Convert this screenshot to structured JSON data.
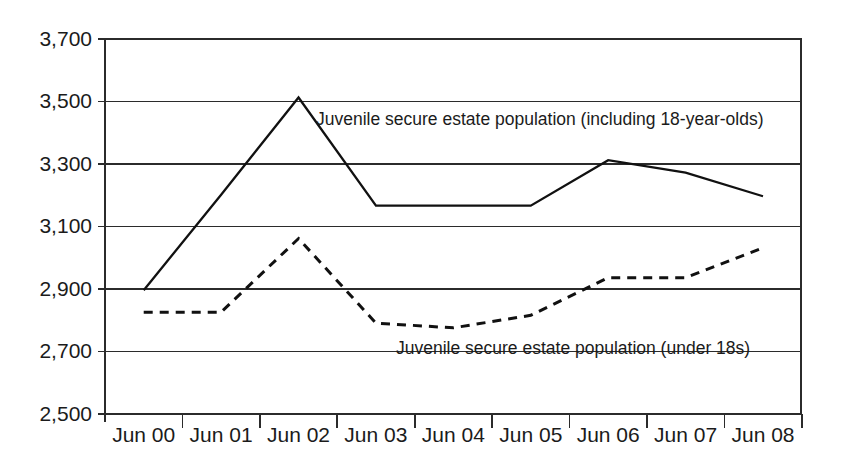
{
  "chart_data": {
    "type": "line",
    "title": "",
    "subtitle": "",
    "xlabel": "",
    "ylabel": "",
    "grid": true,
    "legend_position": "inline-annotation",
    "categories": [
      "Jun 00",
      "Jun 01",
      "Jun 02",
      "Jun 03",
      "Jun 04",
      "Jun 05",
      "Jun 06",
      "Jun 07",
      "Jun 08"
    ],
    "ylim": [
      2500,
      3700
    ],
    "ytick_values": [
      3700,
      3500,
      3300,
      3100,
      2900,
      2700,
      2500
    ],
    "ytick_labels": [
      "3,700",
      "3,500",
      "3,300",
      "3,100",
      "2,900",
      "2,700",
      "2,500"
    ],
    "series": [
      {
        "name": "Juvenile secure estate population (including 18-year-olds)",
        "style": "solid",
        "values": [
          2895,
          3200,
          3510,
          3165,
          3165,
          3165,
          3310,
          3270,
          3195
        ]
      },
      {
        "name": "Juvenile secure estate population (under 18s)",
        "style": "dashed",
        "values": [
          2825,
          2825,
          3060,
          2790,
          2775,
          2815,
          2935,
          2935,
          3030
        ]
      }
    ],
    "annotations": [
      {
        "text": "Juvenile secure estate population (including 18-year-olds)",
        "series": "solid",
        "x": 316,
        "y": 120
      },
      {
        "text": "Juvenile secure estate population (under 18s)",
        "series": "dashed",
        "x": 396,
        "y": 349
      }
    ]
  },
  "axes": {
    "y_labels": [
      "3,700",
      "3,500",
      "3,300",
      "3,100",
      "2,900",
      "2,700",
      "2,500"
    ],
    "x_labels": [
      "Jun 00",
      "Jun 01",
      "Jun 02",
      "Jun 03",
      "Jun 04",
      "Jun 05",
      "Jun 06",
      "Jun 07",
      "Jun 08"
    ]
  },
  "colors": {
    "line": "#111111",
    "grid": "#2b2b2b",
    "background": "#ffffff",
    "text": "#1b1b1b"
  }
}
